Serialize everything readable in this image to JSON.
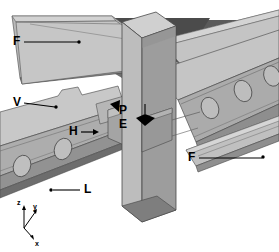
{
  "figure": {
    "type": "technical-line-illustration",
    "background_color": "#ffffff",
    "width": 279,
    "height": 252
  },
  "palette": {
    "background": "#ffffff",
    "panel_light": "#c9c9c9",
    "panel_mid": "#b3b3b3",
    "panel_dark": "#8f8f8f",
    "panel_darker": "#6e6e6e",
    "panel_shadow": "#555555",
    "panel_deep_shadow": "#3c3c3c",
    "column_light": "#c2c2c2",
    "column_mid": "#a8a8a8",
    "column_dark": "#8a8a8a",
    "edge_line": "#4a4a4a",
    "label_text": "#000000",
    "leader_line": "#000000"
  },
  "labels": [
    {
      "id": "F-top-left",
      "text": "F",
      "x": 14,
      "y": 36,
      "leader": {
        "x1": 24,
        "y1": 42,
        "x2": 78,
        "y2": 42
      },
      "dot": {
        "x": 78,
        "y": 42
      }
    },
    {
      "id": "V-left",
      "text": "V",
      "x": 14,
      "y": 97,
      "leader": {
        "x1": 24,
        "y1": 103,
        "x2": 55,
        "y2": 108
      },
      "dot": {
        "x": 55,
        "y": 108
      }
    },
    {
      "id": "H-center-left",
      "text": "H",
      "x": 70,
      "y": 126,
      "arrow": {
        "x1": 81,
        "y1": 132,
        "x2": 97,
        "y2": 132
      },
      "arrow_dir": "right"
    },
    {
      "id": "P-center",
      "text": "P",
      "x": 120,
      "y": 110,
      "arrow_head": {
        "x": 113,
        "y": 104,
        "dir": "left"
      }
    },
    {
      "id": "E-center",
      "text": "E",
      "x": 120,
      "y": 122,
      "arrow_head": {
        "x": 145,
        "y": 122,
        "dir": "down"
      }
    },
    {
      "id": "F-right",
      "text": "F",
      "x": 189,
      "y": 152,
      "leader": {
        "x1": 199,
        "y1": 158,
        "x2": 263,
        "y2": 158
      },
      "dot": {
        "x": 263,
        "y": 158
      }
    },
    {
      "id": "L-bottom-left",
      "text": "L",
      "x": 83,
      "y": 184,
      "leader": {
        "x1": 52,
        "y1": 190,
        "x2": 80,
        "y2": 190
      },
      "dot": {
        "x": 50,
        "y": 190
      }
    }
  ],
  "axis_triad": {
    "origin": {
      "x": 24,
      "y": 228
    },
    "axes": [
      {
        "name": "z",
        "label": "z",
        "label_x": 17,
        "label_y": 201,
        "tip_x": 24,
        "tip_y": 206
      },
      {
        "name": "y",
        "label": "y",
        "label_x": 32,
        "label_y": 204,
        "tip_x": 35,
        "tip_y": 210
      },
      {
        "name": "x",
        "label": "x",
        "label_x": 33,
        "label_y": 240,
        "tip_x": 32,
        "tip_y": 238
      }
    ]
  },
  "legend_meaning": {
    "F": "flange",
    "V": "vertical web plate",
    "H": "horizontal element",
    "P": "plate",
    "E": "end / edge",
    "L": "lip"
  },
  "components": [
    {
      "name": "column",
      "description": "central vertical rectangular hollow-section column"
    },
    {
      "name": "left-beam",
      "description": "left channel beam with oval web holes and notched top flange"
    },
    {
      "name": "right-beam",
      "description": "right channel beam with oval web holes"
    },
    {
      "name": "top-left-plate",
      "description": "upper-left thin flange plate"
    },
    {
      "name": "top-right-plate",
      "description": "upper-right thin flange plate"
    },
    {
      "name": "connection-cleat",
      "description": "connection plate / cleat at column face"
    }
  ]
}
